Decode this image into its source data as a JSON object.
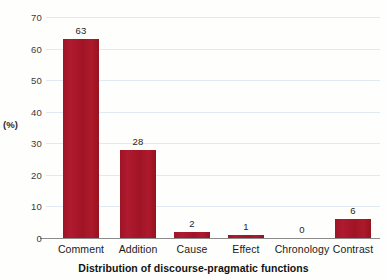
{
  "chart_data": {
    "type": "bar",
    "title": "",
    "xlabel": "Distribution of discourse-pragmatic functions",
    "ylabel": "(%)",
    "categories": [
      "Comment",
      "Addition",
      "Cause",
      "Effect",
      "Chronology",
      "Contrast"
    ],
    "values": [
      63,
      28,
      2,
      1,
      0,
      6
    ],
    "data_labels": [
      "63",
      "28",
      "2",
      "1",
      "0",
      "6"
    ],
    "ylim": [
      0,
      70
    ],
    "yticks": [
      0,
      10,
      20,
      30,
      40,
      50,
      60,
      70
    ],
    "ytick_labels": [
      "0",
      "10",
      "20",
      "30",
      "40",
      "50",
      "60",
      "70"
    ],
    "grid": true,
    "legend": false,
    "bar_color": "#a6172a",
    "gridline_color": "#dfeaf2",
    "axis_color": "#8c8c8c",
    "background_color": "#fefefc"
  }
}
